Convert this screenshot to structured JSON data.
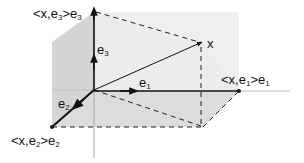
{
  "diagram": {
    "labels": {
      "x": "x",
      "e1": {
        "base": "e",
        "sub": "1"
      },
      "e2": {
        "base": "e",
        "sub": "2"
      },
      "e3": {
        "base": "e",
        "sub": "3"
      },
      "proj_e1": {
        "pre": "<x,e",
        "sub1": "1",
        "mid": ">e",
        "sub2": "1"
      },
      "proj_e2": {
        "pre": "<x,e",
        "sub1": "2",
        "mid": ">e",
        "sub2": "2"
      },
      "proj_e3": {
        "pre": "<x,e",
        "sub1": "3",
        "mid": ">e",
        "sub2": "3"
      }
    },
    "colors": {
      "axis": "#111111",
      "plane_dark": "#d2d2d2",
      "plane_light": "#ececec",
      "thin_axis": "#9a9a9a"
    }
  }
}
